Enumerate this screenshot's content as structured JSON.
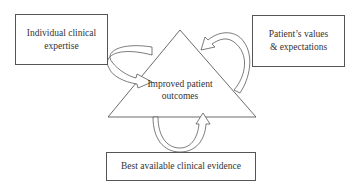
{
  "diagram": {
    "boxes": {
      "left": "Individual clinical expertise",
      "right": "Patient’s values & expectations",
      "bottom": "Best available clinical evidence"
    },
    "center": {
      "line1": "Improved patient",
      "line2": "outcomes"
    }
  }
}
